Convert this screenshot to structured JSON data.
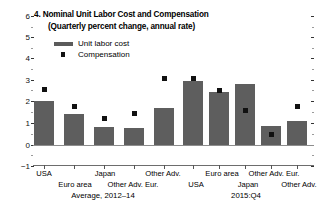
{
  "chart_data": {
    "type": "bar",
    "title": "4. Nominal Unit Labor Cost and Compensation",
    "subtitle": "(Quarterly percent change, annual rate)",
    "xlabel": "",
    "ylabel": "",
    "ylim": [
      -1,
      6
    ],
    "y_ticks": [
      -1,
      0,
      1,
      2,
      3,
      4,
      5,
      6
    ],
    "y_tick_labels": [
      "−1",
      "0",
      "1",
      "2",
      "3",
      "4",
      "5",
      "6"
    ],
    "grid": false,
    "legend_position": "upper-left-inside",
    "legend": [
      {
        "name": "Unit labor cost",
        "kind": "bar",
        "color": "#5e5e5e"
      },
      {
        "name": "Compensation",
        "kind": "square-marker",
        "color": "#111111"
      }
    ],
    "groups": [
      {
        "caption": "Average, 2012–14",
        "categories": [
          "USA",
          "Euro area",
          "Japan",
          "Other Adv. Eur.",
          "Other Adv."
        ],
        "series": [
          {
            "name": "Unit labor cost",
            "values": [
              2.05,
              1.45,
              0.85,
              0.8,
              1.7
            ]
          },
          {
            "name": "Compensation",
            "values": [
              2.6,
              1.8,
              1.25,
              1.45,
              3.1
            ]
          }
        ]
      },
      {
        "caption": "2015:Q4",
        "categories": [
          "USA",
          "Euro area",
          "Japan",
          "Other Adv. Eur.",
          "Other Adv."
        ],
        "series": [
          {
            "name": "Unit labor cost",
            "values": [
              3.0,
              2.45,
              2.85,
              0.9,
              1.1
            ]
          },
          {
            "name": "Compensation",
            "values": [
              3.1,
              2.55,
              1.6,
              0.5,
              1.8
            ]
          }
        ]
      }
    ]
  },
  "axis": {
    "y_label_6": "6",
    "y_label_5": "5",
    "y_label_4": "4",
    "y_label_3": "3",
    "y_label_2": "2",
    "y_label_1": "1",
    "y_label_0": "0",
    "y_label_neg1": "−1"
  },
  "legend": {
    "item1": "Unit labor cost",
    "item2": "Compensation"
  },
  "xaxis": {
    "left": {
      "usa": "USA",
      "euro_area": "Euro area",
      "japan": "Japan",
      "other_adv_eur": "Other Adv. Eur.",
      "other_adv": "Other Adv.",
      "caption": "Average, 2012–14"
    },
    "right": {
      "usa": "USA",
      "euro_area": "Euro area",
      "japan": "Japan",
      "other_adv_eur": "Other Adv. Eur.",
      "other_adv": "Other Adv.",
      "caption": "2015:Q4"
    }
  },
  "colors": {
    "bar": "#5e5e5e",
    "marker": "#111111",
    "axis": "#555555"
  }
}
